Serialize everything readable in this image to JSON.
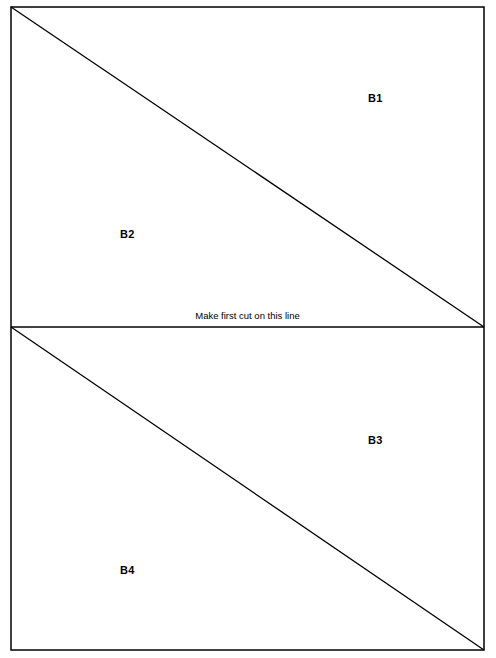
{
  "document": {
    "title": "Cutting template sheet",
    "background_color": "#ffffff",
    "line_color": "#000000",
    "text_color": "#000000"
  },
  "sheet": {
    "border": {
      "x": 11,
      "y": 7,
      "width": 473,
      "height": 643,
      "stroke_width": 1.5
    },
    "divider": {
      "y": 327,
      "x1": 11,
      "x2": 484,
      "stroke_width": 1.5
    }
  },
  "panels": [
    {
      "name": "top-panel",
      "diagonal": {
        "x1": 11,
        "y1": 7,
        "x2": 484,
        "y2": 327,
        "stroke_width": 1.3
      },
      "labels": [
        {
          "id": "B1",
          "text": "B1",
          "position": "upper-right"
        },
        {
          "id": "B2",
          "text": "B2",
          "position": "lower-left"
        }
      ]
    },
    {
      "name": "bottom-panel",
      "diagonal": {
        "x1": 11,
        "y1": 327,
        "x2": 484,
        "y2": 650,
        "stroke_width": 1.3
      },
      "labels": [
        {
          "id": "B3",
          "text": "B3",
          "position": "upper-right"
        },
        {
          "id": "B4",
          "text": "B4",
          "position": "lower-left"
        }
      ]
    }
  ],
  "annotations": {
    "cut_instruction": "Make first cut on this line"
  }
}
